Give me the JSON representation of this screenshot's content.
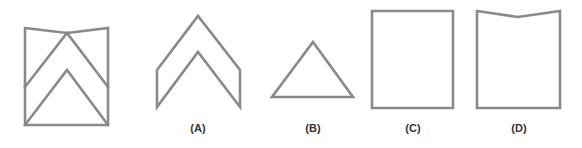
{
  "figure": {
    "question_shape": {
      "name": "composite figure with notched top and two chevrons",
      "outline": [
        [
          25,
          28
        ],
        [
          67,
          33
        ],
        [
          108,
          28
        ],
        [
          108,
          125
        ],
        [
          25,
          125
        ]
      ],
      "outer_chevron": [
        [
          25,
          87
        ],
        [
          67,
          33
        ],
        [
          108,
          87
        ]
      ],
      "inner_chevron": [
        [
          25,
          125
        ],
        [
          67,
          70
        ],
        [
          108,
          125
        ]
      ]
    },
    "options": [
      {
        "label": "(A)",
        "shape": "chevron",
        "points": [
          [
            157,
            70
          ],
          [
            198,
            16
          ],
          [
            240,
            70
          ],
          [
            240,
            107
          ],
          [
            198,
            52
          ],
          [
            157,
            107
          ]
        ],
        "label_x": 198
      },
      {
        "label": "(B)",
        "shape": "triangle",
        "points": [
          [
            313,
            42
          ],
          [
            353,
            97
          ],
          [
            272,
            97
          ]
        ],
        "label_x": 313
      },
      {
        "label": "(C)",
        "shape": "rectangle",
        "points": [
          [
            372,
            11
          ],
          [
            453,
            11
          ],
          [
            453,
            108
          ],
          [
            372,
            108
          ]
        ],
        "label_x": 413
      },
      {
        "label": "(D)",
        "shape": "notched-rectangle",
        "points": [
          [
            477,
            11
          ],
          [
            518,
            17
          ],
          [
            560,
            11
          ],
          [
            560,
            108
          ],
          [
            477,
            108
          ]
        ],
        "label_x": 519
      }
    ],
    "stroke_color": "#8a8a8a"
  }
}
